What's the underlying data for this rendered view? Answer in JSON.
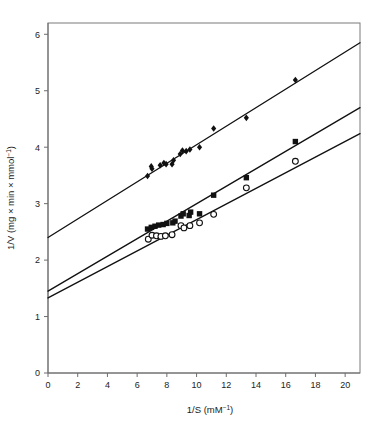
{
  "chart_data": {
    "type": "scatter",
    "title": "",
    "subtitle": "",
    "xlabel": "1/S (mM⁻¹)",
    "ylabel": "1/V (mg × min × mmol⁻¹)",
    "xlabel_parts": {
      "base": "1/S (mM",
      "sup": "−1",
      "tail": ")"
    },
    "ylabel_parts": {
      "base": "1/V (mg × min × mmol",
      "sup": "−1",
      "tail": ")"
    },
    "xlim": [
      0,
      21
    ],
    "ylim": [
      0,
      6.2
    ],
    "xticks": [
      0,
      2,
      4,
      6,
      8,
      10,
      12,
      14,
      16,
      18,
      20
    ],
    "xtick_labels": [
      "0",
      "2",
      "4",
      "6",
      "8",
      "10",
      "12",
      "14",
      "16",
      "18",
      "20"
    ],
    "yticks": [
      0,
      1,
      2,
      3,
      4,
      5,
      6
    ],
    "ytick_labels": [
      "0",
      "1",
      "2",
      "3",
      "4",
      "5",
      "6"
    ],
    "grid": false,
    "legend": "none",
    "frame": "box",
    "series": [
      {
        "name": "series-diamonds",
        "marker": "filled-diamond",
        "color": "#111111",
        "fit_line": {
          "intercept": 2.4,
          "slope": 0.1643,
          "x_start": 0,
          "x_end": 21
        },
        "points": [
          {
            "x": 6.7,
            "y": 3.49
          },
          {
            "x": 6.95,
            "y": 3.66
          },
          {
            "x": 7.0,
            "y": 3.62
          },
          {
            "x": 7.55,
            "y": 3.68
          },
          {
            "x": 7.8,
            "y": 3.72
          },
          {
            "x": 7.95,
            "y": 3.7
          },
          {
            "x": 8.35,
            "y": 3.7
          },
          {
            "x": 8.45,
            "y": 3.77
          },
          {
            "x": 8.9,
            "y": 3.88
          },
          {
            "x": 9.05,
            "y": 3.94
          },
          {
            "x": 9.3,
            "y": 3.93
          },
          {
            "x": 9.55,
            "y": 3.96
          },
          {
            "x": 10.2,
            "y": 4.0
          },
          {
            "x": 11.15,
            "y": 4.33
          },
          {
            "x": 13.35,
            "y": 4.52
          },
          {
            "x": 16.65,
            "y": 5.19
          }
        ]
      },
      {
        "name": "series-squares",
        "marker": "filled-square",
        "color": "#111111",
        "fit_line": {
          "intercept": 1.45,
          "slope": 0.1548,
          "x_start": 0,
          "x_end": 21
        },
        "points": [
          {
            "x": 6.7,
            "y": 2.55
          },
          {
            "x": 6.95,
            "y": 2.58
          },
          {
            "x": 7.2,
            "y": 2.6
          },
          {
            "x": 7.45,
            "y": 2.62
          },
          {
            "x": 7.75,
            "y": 2.63
          },
          {
            "x": 8.0,
            "y": 2.65
          },
          {
            "x": 8.4,
            "y": 2.66
          },
          {
            "x": 8.55,
            "y": 2.69
          },
          {
            "x": 8.95,
            "y": 2.78
          },
          {
            "x": 9.1,
            "y": 2.82
          },
          {
            "x": 9.5,
            "y": 2.79
          },
          {
            "x": 9.6,
            "y": 2.85
          },
          {
            "x": 10.2,
            "y": 2.82
          },
          {
            "x": 11.15,
            "y": 3.15
          },
          {
            "x": 13.35,
            "y": 3.46
          },
          {
            "x": 16.65,
            "y": 4.1
          }
        ]
      },
      {
        "name": "series-open-circles",
        "marker": "open-circle",
        "color": "#111111",
        "fit_line": {
          "intercept": 1.33,
          "slope": 0.1386,
          "x_start": 0,
          "x_end": 21
        },
        "points": [
          {
            "x": 6.75,
            "y": 2.37
          },
          {
            "x": 7.0,
            "y": 2.44
          },
          {
            "x": 7.3,
            "y": 2.43
          },
          {
            "x": 7.6,
            "y": 2.42
          },
          {
            "x": 7.9,
            "y": 2.43
          },
          {
            "x": 8.35,
            "y": 2.45
          },
          {
            "x": 8.95,
            "y": 2.61
          },
          {
            "x": 9.15,
            "y": 2.57
          },
          {
            "x": 9.55,
            "y": 2.61
          },
          {
            "x": 10.2,
            "y": 2.66
          },
          {
            "x": 11.15,
            "y": 2.81
          },
          {
            "x": 13.35,
            "y": 3.28
          },
          {
            "x": 16.65,
            "y": 3.75
          }
        ]
      }
    ]
  }
}
